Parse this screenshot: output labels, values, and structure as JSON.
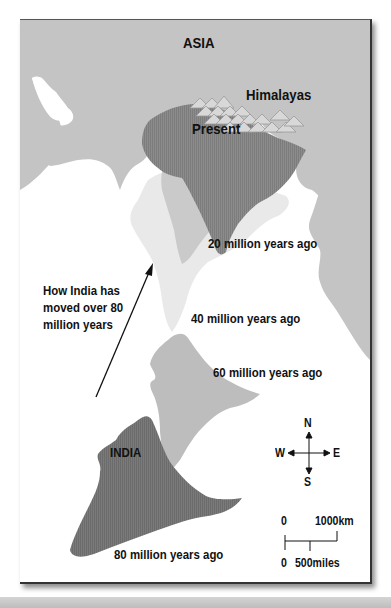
{
  "map": {
    "title_region": "ASIA",
    "mountains_label": "Himalayas",
    "present_label": "Present",
    "india_label": "INDIA",
    "positions": [
      {
        "label": "Present",
        "age_ma": 0
      },
      {
        "label": "20 million years ago",
        "age_ma": 20
      },
      {
        "label": "40 million years ago",
        "age_ma": 40
      },
      {
        "label": "60 million years ago",
        "age_ma": 60
      },
      {
        "label": "80 million years ago",
        "age_ma": 80
      }
    ],
    "note_lines": [
      "How India has",
      "moved over 80",
      "million years"
    ],
    "compass": {
      "n": "N",
      "s": "S",
      "e": "E",
      "w": "W"
    },
    "scale": {
      "km_zero": "0",
      "km_max": "1000km",
      "mi_zero": "0",
      "mi_mid": "500miles"
    },
    "colors": {
      "land": "#c4c4c4",
      "sea": "#ffffff",
      "present": "#8f8f8f",
      "ma20": "#cacaca",
      "ma40": "#e9e9e9",
      "ma60": "#bdbdbd",
      "ma80": "#7a7a7a"
    }
  }
}
